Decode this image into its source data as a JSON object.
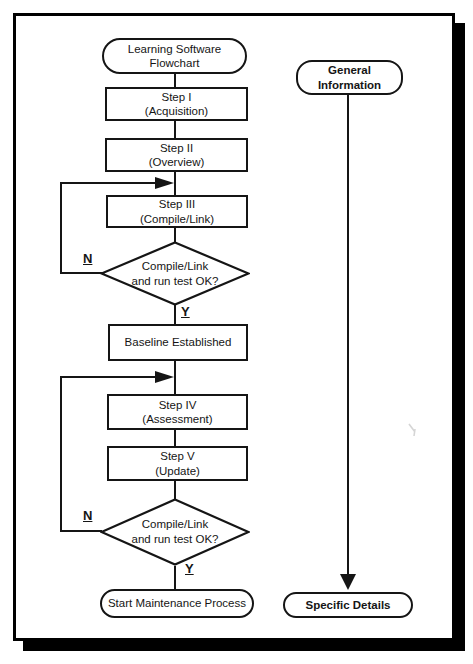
{
  "page": {
    "background": "#ffffff",
    "ink": "#151515",
    "frame_color": "#000000"
  },
  "flowchart": {
    "start": {
      "line1": "Learning Software",
      "line2": "Flowchart"
    },
    "step1": {
      "line1": "Step I",
      "line2": "(Acquisition)"
    },
    "step2": {
      "line1": "Step II",
      "line2": "(Overview)"
    },
    "step3": {
      "line1": "Step III",
      "line2": "(Compile/Link)"
    },
    "decision1": {
      "line1": "Compile/Link",
      "line2": "and run test OK?",
      "no": "N",
      "yes": "Y"
    },
    "baseline": {
      "line1": "Baseline Established"
    },
    "step4": {
      "line1": "Step IV",
      "line2": "(Assessment)"
    },
    "step5": {
      "line1": "Step V",
      "line2": "(Update)"
    },
    "decision2": {
      "line1": "Compile/Link",
      "line2": "and run test OK?",
      "no": "N",
      "yes": "Y"
    },
    "end": {
      "line1": "Start Maintenance Process"
    }
  },
  "sidebar": {
    "top": {
      "line1": "General",
      "line2": "Information"
    },
    "bottom": {
      "line1": "Specific Details"
    }
  }
}
